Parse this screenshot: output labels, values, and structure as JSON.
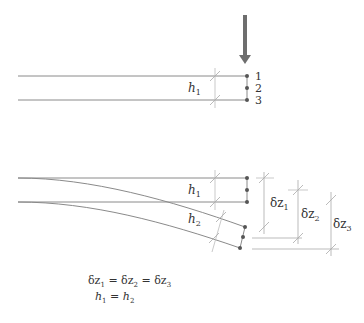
{
  "diagram": {
    "top_panel": {
      "layer_labels": [
        "1",
        "2",
        "3"
      ],
      "thickness_label": "h",
      "thickness_sub": "1",
      "load_arrow": "downward-force"
    },
    "bottom_panel": {
      "thickness_labels": [
        {
          "base": "h",
          "sub": "1"
        },
        {
          "base": "h",
          "sub": "2"
        }
      ],
      "deflections": [
        {
          "base": "δz",
          "sub": "1"
        },
        {
          "base": "δz",
          "sub": "2"
        },
        {
          "base": "δz",
          "sub": "3"
        }
      ]
    },
    "equations": {
      "line1": {
        "parts": [
          "δz",
          "1",
          " = δz",
          "2",
          " = δz",
          "3"
        ]
      },
      "line2": {
        "parts": [
          "h",
          "1",
          " = ",
          "h",
          "2"
        ]
      }
    },
    "colors": {
      "line": "#8a8a8a",
      "arrow": "#6e6e6e",
      "point": "#555555",
      "text": "#333333"
    }
  }
}
